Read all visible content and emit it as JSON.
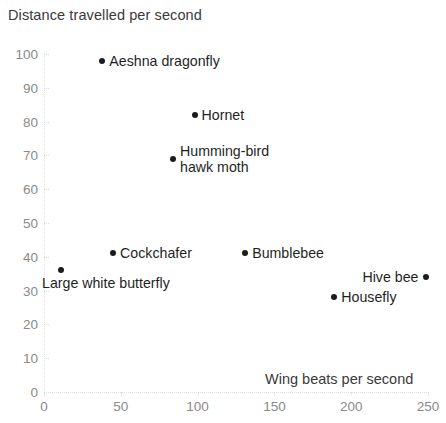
{
  "chart_data": {
    "type": "scatter",
    "title": "Distance travelled per second",
    "xlabel": "Wing beats per second",
    "ylabel": "Distance travelled per second",
    "xlim": [
      0,
      250
    ],
    "ylim": [
      0,
      100
    ],
    "xticks": [
      0,
      50,
      100,
      150,
      200,
      250
    ],
    "yticks": [
      0,
      10,
      20,
      30,
      40,
      50,
      60,
      70,
      80,
      90,
      100
    ],
    "grid": false,
    "legend": "none",
    "point_color": "#1c1c1c",
    "points": [
      {
        "label": "Aeshna dragonfly",
        "x": 38,
        "y": 98,
        "label_position": "right"
      },
      {
        "label": "Hornet",
        "x": 98,
        "y": 82,
        "label_position": "right"
      },
      {
        "label": "Humming-bird\nhawk moth",
        "x": 84,
        "y": 69,
        "label_position": "right"
      },
      {
        "label": "Cockchafer",
        "x": 45,
        "y": 41,
        "label_position": "right"
      },
      {
        "label": "Bumblebee",
        "x": 131,
        "y": 41,
        "label_position": "right"
      },
      {
        "label": "Large white butterfly",
        "x": 11,
        "y": 36,
        "label_position": "below"
      },
      {
        "label": "Hive bee",
        "x": 249,
        "y": 34,
        "label_position": "left"
      },
      {
        "label": "Housefly",
        "x": 189,
        "y": 28,
        "label_position": "right"
      }
    ]
  }
}
